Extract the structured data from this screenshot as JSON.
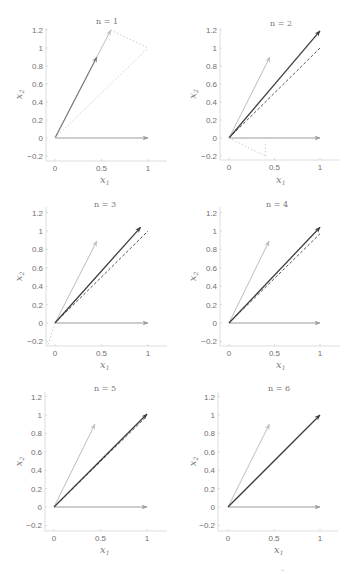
{
  "figure": {
    "panel_count": 6,
    "footer_fragment": "~"
  },
  "styles": {
    "basis": {
      "color": "#9a9a9a",
      "dash": "",
      "width": 1.0,
      "head": true
    },
    "light": {
      "color": "#bdbdbd",
      "dash": "",
      "width": 1.0,
      "head": true
    },
    "mid": {
      "color": "#7a7a7a",
      "dash": "",
      "width": 1.1,
      "head": true
    },
    "dark": {
      "color": "#3e3e3e",
      "dash": "",
      "width": 1.3,
      "head": true
    },
    "target": {
      "color": "#555555",
      "dash": "3,2",
      "width": 1.0,
      "head": false
    },
    "faint": {
      "color": "#cccccc",
      "dash": "1.5,2",
      "width": 1.0,
      "head": false
    }
  },
  "chart_data": [
    {
      "type": "line",
      "title": "n = 1",
      "xlabel": "x",
      "xlabel_sub": "1",
      "ylabel": "x",
      "ylabel_sub": "2",
      "xlim": [
        0,
        1
      ],
      "ylim": [
        -0.2,
        1.2
      ],
      "xticks": [
        "0",
        "0.5",
        "1"
      ],
      "yticks": [
        "1.2",
        "1",
        "0.8",
        "0.6",
        "0.4",
        "0.2",
        "0",
        "-0.2"
      ],
      "vectors": [
        {
          "name": "basis-e1",
          "from": [
            0,
            0
          ],
          "to": [
            1,
            0
          ],
          "style": "basis"
        },
        {
          "name": "light-long",
          "from": [
            0,
            0
          ],
          "to": [
            0.6,
            1.2
          ],
          "style": "light"
        },
        {
          "name": "current",
          "from": [
            0,
            0
          ],
          "to": [
            0.45,
            0.9
          ],
          "style": "mid"
        },
        {
          "name": "target",
          "from": [
            0,
            0
          ],
          "to": [
            1,
            1
          ],
          "style": "faint"
        },
        {
          "name": "difference",
          "from": [
            0.6,
            1.2
          ],
          "to": [
            1,
            1
          ],
          "style": "faint"
        }
      ]
    },
    {
      "type": "line",
      "title": "n = 2",
      "xlabel": "x",
      "xlabel_sub": "1",
      "ylabel": "x",
      "ylabel_sub": "2",
      "xlim": [
        0,
        1
      ],
      "ylim": [
        -0.2,
        1.2
      ],
      "xticks": [
        "0",
        "0.5",
        "1"
      ],
      "yticks": [
        "1.2",
        "1",
        "0.8",
        "0.6",
        "0.4",
        "0.2",
        "0",
        "-0.2"
      ],
      "vectors": [
        {
          "name": "basis-e1",
          "from": [
            0,
            0
          ],
          "to": [
            1,
            0
          ],
          "style": "basis"
        },
        {
          "name": "light-short",
          "from": [
            0,
            0
          ],
          "to": [
            0.45,
            0.9
          ],
          "style": "light"
        },
        {
          "name": "target",
          "from": [
            0,
            0
          ],
          "to": [
            1,
            1
          ],
          "style": "target"
        },
        {
          "name": "current",
          "from": [
            0,
            0
          ],
          "to": [
            1,
            1.19
          ],
          "style": "dark"
        },
        {
          "name": "difference",
          "from": [
            0,
            0
          ],
          "to": [
            0.4,
            -0.2
          ],
          "style": "faint"
        },
        {
          "name": "difference-proj",
          "from": [
            0.4,
            -0.2
          ],
          "to": [
            0.4,
            -0.04
          ],
          "style": "faint"
        }
      ]
    },
    {
      "type": "line",
      "title": "n = 3",
      "xlabel": "x",
      "xlabel_sub": "1",
      "ylabel": "x",
      "ylabel_sub": "2",
      "xlim": [
        0,
        1
      ],
      "ylim": [
        -0.2,
        1.2
      ],
      "xticks": [
        "0",
        "0.5",
        "1"
      ],
      "yticks": [
        "1.2",
        "1",
        "0.8",
        "0.6",
        "0.4",
        "0.2",
        "0",
        "-0.2"
      ],
      "vectors": [
        {
          "name": "basis-e1",
          "from": [
            0,
            0
          ],
          "to": [
            1,
            0
          ],
          "style": "basis"
        },
        {
          "name": "light-short",
          "from": [
            0,
            0
          ],
          "to": [
            0.45,
            0.89
          ],
          "style": "light"
        },
        {
          "name": "target",
          "from": [
            0,
            0
          ],
          "to": [
            1,
            1
          ],
          "style": "target"
        },
        {
          "name": "current",
          "from": [
            0,
            0
          ],
          "to": [
            0.92,
            1.04
          ],
          "style": "dark"
        },
        {
          "name": "difference",
          "from": [
            0,
            0
          ],
          "to": [
            -0.08,
            -0.25
          ],
          "style": "faint"
        }
      ]
    },
    {
      "type": "line",
      "title": "n = 4",
      "xlabel": "x",
      "xlabel_sub": "1",
      "ylabel": "x",
      "ylabel_sub": "2",
      "xlim": [
        0,
        1
      ],
      "ylim": [
        -0.2,
        1.2
      ],
      "xticks": [
        "0",
        "0.5",
        "1"
      ],
      "yticks": [
        "1.2",
        "1",
        "0.8",
        "0.6",
        "0.4",
        "0.2",
        "0",
        "-0.2"
      ],
      "vectors": [
        {
          "name": "basis-e1",
          "from": [
            0,
            0
          ],
          "to": [
            1,
            0
          ],
          "style": "basis"
        },
        {
          "name": "light-short",
          "from": [
            0,
            0
          ],
          "to": [
            0.44,
            0.89
          ],
          "style": "light"
        },
        {
          "name": "target",
          "from": [
            0,
            0
          ],
          "to": [
            1,
            0.97
          ],
          "style": "target"
        },
        {
          "name": "current",
          "from": [
            0,
            0
          ],
          "to": [
            1,
            1.04
          ],
          "style": "dark"
        }
      ]
    },
    {
      "type": "line",
      "title": "n = 5",
      "xlabel": "x",
      "xlabel_sub": "1",
      "ylabel": "x",
      "ylabel_sub": "2",
      "xlim": [
        0,
        1
      ],
      "ylim": [
        -0.2,
        1.2
      ],
      "xticks": [
        "0",
        "0.5",
        "1"
      ],
      "yticks": [
        "1.2",
        "1",
        "0.8",
        "0.6",
        "0.4",
        "0.2",
        "0",
        "-0.2"
      ],
      "vectors": [
        {
          "name": "basis-e1",
          "from": [
            0,
            0
          ],
          "to": [
            1,
            0
          ],
          "style": "basis"
        },
        {
          "name": "light-short",
          "from": [
            0,
            0
          ],
          "to": [
            0.44,
            0.9
          ],
          "style": "light"
        },
        {
          "name": "target",
          "from": [
            0,
            0
          ],
          "to": [
            1,
            0.99
          ],
          "style": "target"
        },
        {
          "name": "current",
          "from": [
            0,
            0
          ],
          "to": [
            1,
            1.01
          ],
          "style": "dark"
        }
      ]
    },
    {
      "type": "line",
      "title": "n = 6",
      "xlabel": "x",
      "xlabel_sub": "1",
      "ylabel": "x",
      "ylabel_sub": "2",
      "xlim": [
        0,
        1
      ],
      "ylim": [
        -0.2,
        1.2
      ],
      "xticks": [
        "0",
        "0.5",
        "1"
      ],
      "yticks": [
        "1.2",
        "1",
        "0.8",
        "0.6",
        "0.4",
        "0.2",
        "0",
        "-0.2"
      ],
      "vectors": [
        {
          "name": "basis-e1",
          "from": [
            0,
            0
          ],
          "to": [
            1,
            0
          ],
          "style": "basis"
        },
        {
          "name": "light-short",
          "from": [
            0,
            0
          ],
          "to": [
            0.45,
            0.9
          ],
          "style": "light"
        },
        {
          "name": "target",
          "from": [
            0,
            0
          ],
          "to": [
            1,
            1
          ],
          "style": "target"
        },
        {
          "name": "current",
          "from": [
            0,
            0
          ],
          "to": [
            1,
            1
          ],
          "style": "dark"
        }
      ]
    }
  ]
}
